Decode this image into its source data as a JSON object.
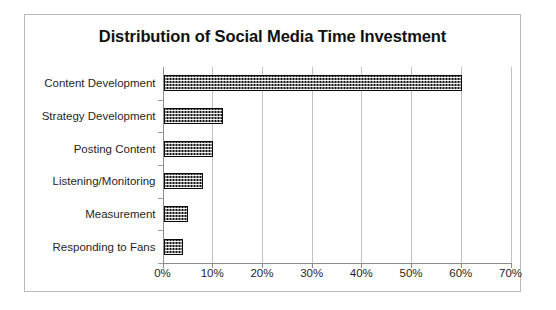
{
  "chart_data": {
    "type": "bar",
    "orientation": "horizontal",
    "title": "Distribution of Social Media Time Investment",
    "xlabel": "",
    "ylabel": "",
    "categories": [
      "Content Development",
      "Strategy Development",
      "Posting Content",
      "Listening/Monitoring",
      "Measurement",
      "Responding to Fans"
    ],
    "values": [
      60,
      12,
      10,
      8,
      5,
      4
    ],
    "value_unit": "%",
    "xlim": [
      0,
      70
    ],
    "xticks": [
      0,
      10,
      20,
      30,
      40,
      50,
      60,
      70
    ],
    "xtick_labels": [
      "0%",
      "10%",
      "20%",
      "30%",
      "40%",
      "50%",
      "60%",
      "70%"
    ],
    "grid": "vertical",
    "legend": "none",
    "series": [
      {
        "name": "Share of time",
        "values": [
          60,
          12,
          10,
          8,
          5,
          4
        ],
        "fill": "#131313",
        "pattern": "checkered-dots"
      }
    ],
    "colors": {
      "bar": "#131313",
      "gridline": "#c2c2c2",
      "axis": "#8c8c8c",
      "text": "#1f1f1f",
      "frame_border": "#b9b9b9",
      "background": "#ffffff"
    }
  }
}
